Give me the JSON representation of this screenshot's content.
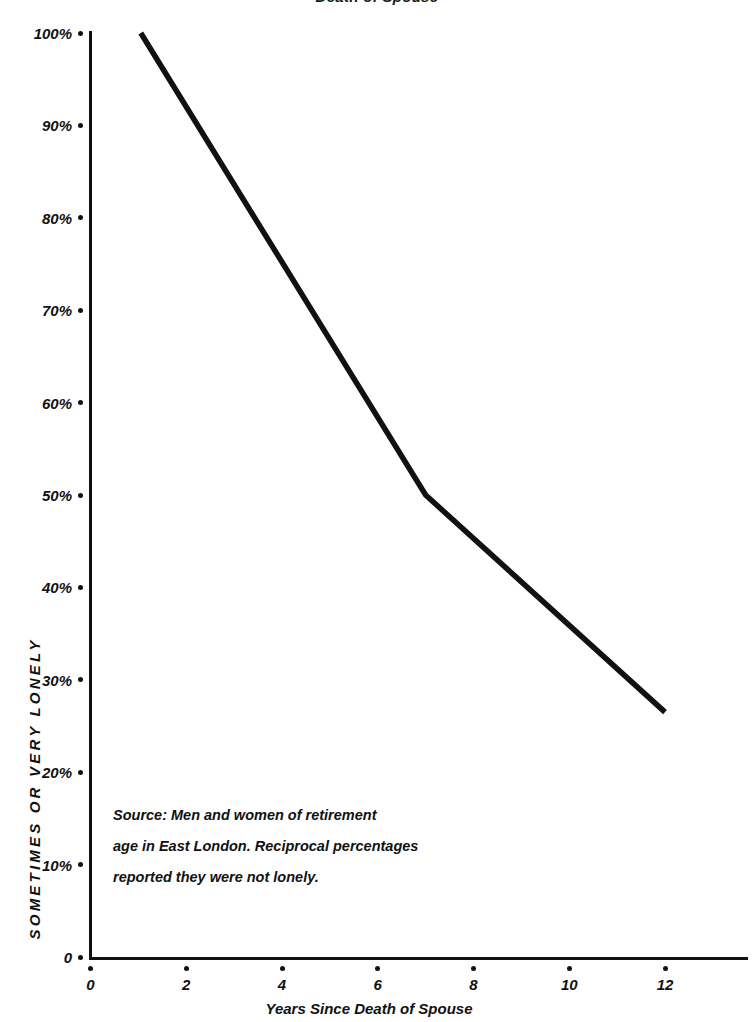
{
  "chart_data": {
    "type": "line",
    "title": "Death of Spouse",
    "xlabel": "Years Since Death of Spouse",
    "ylabel": "SOMETIMES OR VERY LONELY",
    "xlim": [
      0,
      14.2
    ],
    "ylim": [
      0,
      100
    ],
    "grid": false,
    "legend": "none",
    "x_ticks": [
      "0",
      "2",
      "4",
      "6",
      "8",
      "10",
      "12"
    ],
    "x_tick_values": [
      0,
      2,
      4,
      6,
      8,
      10,
      12
    ],
    "y_ticks": [
      "0",
      "10%",
      "20%",
      "30%",
      "40%",
      "50%",
      "60%",
      "70%",
      "80%",
      "90%",
      "100%"
    ],
    "y_tick_values": [
      0,
      10,
      20,
      30,
      40,
      50,
      60,
      70,
      80,
      90,
      100
    ],
    "series": [
      {
        "name": "Sometimes or very lonely",
        "color": "#111111",
        "points": [
          {
            "x": 1.05,
            "y": 100
          },
          {
            "x": 7.0,
            "y": 50
          },
          {
            "x": 12.0,
            "y": 26.5
          }
        ]
      }
    ],
    "annotations": [
      "Source: Men and women of retirement",
      "age  in East London. Reciprocal percentages",
      "reported they were not lonely."
    ]
  },
  "source_note": {
    "line1": "Source: Men and women of retirement",
    "line2": "age  in East London. Reciprocal percentages",
    "line3": "reported they were not lonely."
  },
  "colors": {
    "ink": "#111111",
    "paper": "#ffffff",
    "series": "#111111"
  }
}
